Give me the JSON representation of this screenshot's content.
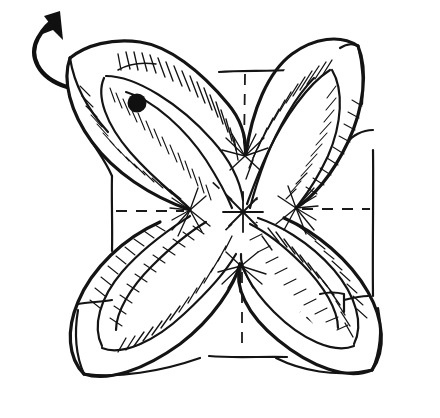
{
  "figure": {
    "kind": "origami-diagram",
    "title": "Origami step: square base with four petal flaps folded outward",
    "background_color": "#ffffff",
    "ink_color": "#141414",
    "width": 440,
    "height": 418,
    "style": "hand-drawn pen and ink line art with hatching"
  },
  "canvas": {
    "center_x": 243,
    "center_y": 212
  },
  "annotations": {
    "rotate_arrow": {
      "label": "turn-over-arrow",
      "description": "curved arrow at top-left indicating the model is rotated / turned over",
      "tip_x": 58,
      "tip_y": 14,
      "tail_x": 66,
      "tail_y": 85,
      "color": "#101010"
    },
    "reference_dot": {
      "label": "reference-point-dot",
      "description": "solid black dot marking a reference corner on the upper-left petal",
      "cx": 137,
      "cy": 103,
      "r": 9,
      "color": "#101010"
    },
    "center_star": {
      "label": "center-crease-intersection",
      "description": "eight-ray star marking the centre where all crease lines meet",
      "cx": 243,
      "cy": 212,
      "rays": 8,
      "radius": 22
    }
  },
  "geometry": {
    "square_edges": {
      "top_y": 71,
      "bottom_y": 357,
      "left_x": 112,
      "right_x": 373,
      "description": "flat square-paper edges visible between the four petals"
    },
    "petal_tips": [
      {
        "name": "top-left-petal-tip",
        "x": 72,
        "y": 56
      },
      {
        "name": "top-right-petal-tip",
        "x": 357,
        "y": 44
      },
      {
        "name": "bottom-right-petal-tip",
        "x": 372,
        "y": 368
      },
      {
        "name": "bottom-left-petal-tip",
        "x": 85,
        "y": 372
      }
    ],
    "inner_vertices": [
      {
        "name": "left-vertex",
        "x": 190,
        "y": 211
      },
      {
        "name": "right-vertex",
        "x": 296,
        "y": 208
      },
      {
        "name": "top-vertex",
        "x": 245,
        "y": 158
      },
      {
        "name": "bottom-vertex",
        "x": 241,
        "y": 266
      }
    ]
  },
  "legend": {
    "valley_fold": "dashed line",
    "edge": "solid line",
    "shaded_face": "hatched area",
    "rotation": "curved arrow"
  }
}
